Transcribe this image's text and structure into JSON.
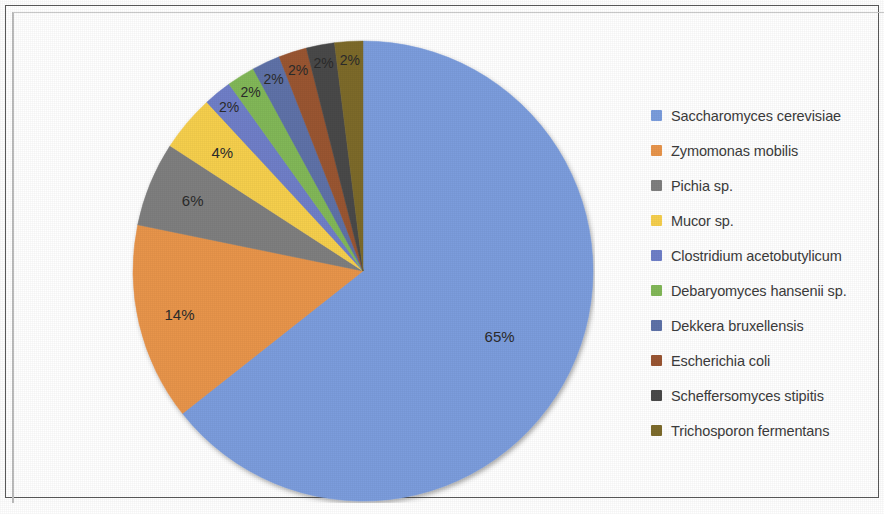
{
  "figure": {
    "kind": "pie-chart",
    "background_color": "#ffffff",
    "frame_color": "#5a5a5a"
  },
  "chart_data": {
    "type": "pie",
    "title": "",
    "subtitle": "",
    "xlabel": "",
    "ylabel": "",
    "grid": false,
    "legend_position": "right",
    "unit": "%",
    "labels_shown_on_slices": true,
    "start_angle_deg": 0,
    "direction": "clockwise",
    "categories": [
      "Saccharomyces cerevisiae",
      "Zymomonas mobilis",
      "Pichia sp.",
      "Mucor sp.",
      "Clostridium acetobutylicum",
      "Debaryomyces hansenii sp.",
      "Dekkera bruxellensis",
      "Escherichia coli",
      "Scheffersomyces stipitis",
      "Trichosporon fermentans"
    ],
    "values": [
      65,
      14,
      6,
      4,
      2,
      2,
      2,
      2,
      2,
      2
    ],
    "value_labels": [
      "65%",
      "14%",
      "6%",
      "4%",
      "2%",
      "2%",
      "2%",
      "2%",
      "2%",
      "2%"
    ],
    "colors": [
      "#7b9ddd",
      "#e8954c",
      "#7f7f7f",
      "#f6cf4e",
      "#6f7fc8",
      "#82b858",
      "#5e72a8",
      "#9a5633",
      "#4a4a4a",
      "#7d6b2c"
    ],
    "slices": [
      {
        "label": "Saccharomyces cerevisiae",
        "value": 65,
        "value_label": "65%",
        "color": "#7b9ddd"
      },
      {
        "label": "Zymomonas mobilis",
        "value": 14,
        "value_label": "14%",
        "color": "#e8954c"
      },
      {
        "label": "Pichia sp.",
        "value": 6,
        "value_label": "6%",
        "color": "#7f7f7f"
      },
      {
        "label": "Mucor sp.",
        "value": 4,
        "value_label": "4%",
        "color": "#f6cf4e"
      },
      {
        "label": "Clostridium acetobutylicum",
        "value": 2,
        "value_label": "2%",
        "color": "#6f7fc8"
      },
      {
        "label": "Debaryomyces hansenii sp.",
        "value": 2,
        "value_label": "2%",
        "color": "#82b858"
      },
      {
        "label": "Dekkera bruxellensis",
        "value": 2,
        "value_label": "2%",
        "color": "#5e72a8"
      },
      {
        "label": "Escherichia coli",
        "value": 2,
        "value_label": "2%",
        "color": "#9a5633"
      },
      {
        "label": "Scheffersomyces stipitis",
        "value": 2,
        "value_label": "2%",
        "color": "#4a4a4a"
      },
      {
        "label": "Trichosporon fermentans",
        "value": 2,
        "value_label": "2%",
        "color": "#7d6b2c"
      }
    ]
  },
  "legend": {
    "items": [
      {
        "label": "Saccharomyces cerevisiae",
        "color": "#7b9ddd"
      },
      {
        "label": "Zymomonas mobilis",
        "color": "#e8954c"
      },
      {
        "label": "Pichia sp.",
        "color": "#7f7f7f"
      },
      {
        "label": "Mucor sp.",
        "color": "#f6cf4e"
      },
      {
        "label": "Clostridium acetobutylicum",
        "color": "#6f7fc8"
      },
      {
        "label": "Debaryomyces hansenii sp.",
        "color": "#82b858"
      },
      {
        "label": "Dekkera bruxellensis",
        "color": "#5e72a8"
      },
      {
        "label": "Escherichia coli",
        "color": "#9a5633"
      },
      {
        "label": "Scheffersomyces stipitis",
        "color": "#4a4a4a"
      },
      {
        "label": "Trichosporon fermentans",
        "color": "#7d6b2c"
      }
    ]
  }
}
